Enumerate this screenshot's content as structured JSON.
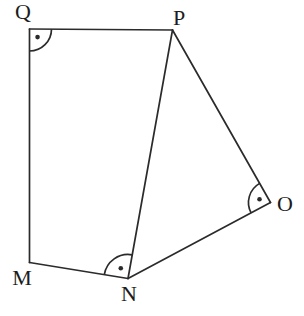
{
  "figure": {
    "width": 304,
    "height": 316,
    "background_color": "#ffffff",
    "line_color": "#2b2b2b",
    "label_color": "#1c1c1c",
    "stroke_width": 1.7,
    "label_font_size": 22,
    "vertices": [
      {
        "id": "Q",
        "label": "Q",
        "x": 29.5,
        "y": 29,
        "label_x": 23,
        "label_y": 19
      },
      {
        "id": "P",
        "label": "P",
        "x": 172.5,
        "y": 30,
        "label_x": 179,
        "label_y": 25
      },
      {
        "id": "O",
        "label": "O",
        "x": 270.5,
        "y": 202.5,
        "label_x": 285,
        "label_y": 211
      },
      {
        "id": "N",
        "label": "N",
        "x": 128,
        "y": 278.5,
        "label_x": 129,
        "label_y": 301
      },
      {
        "id": "M",
        "label": "M",
        "x": 29.5,
        "y": 262.5,
        "label_x": 22,
        "label_y": 285
      }
    ],
    "edges": [
      {
        "from": "Q",
        "to": "P"
      },
      {
        "from": "P",
        "to": "O"
      },
      {
        "from": "O",
        "to": "N"
      },
      {
        "from": "N",
        "to": "M"
      },
      {
        "from": "M",
        "to": "Q"
      },
      {
        "from": "N",
        "to": "P"
      }
    ],
    "right_angle_marks": [
      {
        "at": "Q",
        "arm1": "M",
        "arm2": "P",
        "radius": 22
      },
      {
        "at": "N",
        "arm1": "M",
        "arm2": "P",
        "radius": 24
      },
      {
        "at": "O",
        "arm1": "N",
        "arm2": "P",
        "radius": 22
      }
    ],
    "dot_fraction": 0.52,
    "dot_radius": 2.3
  }
}
